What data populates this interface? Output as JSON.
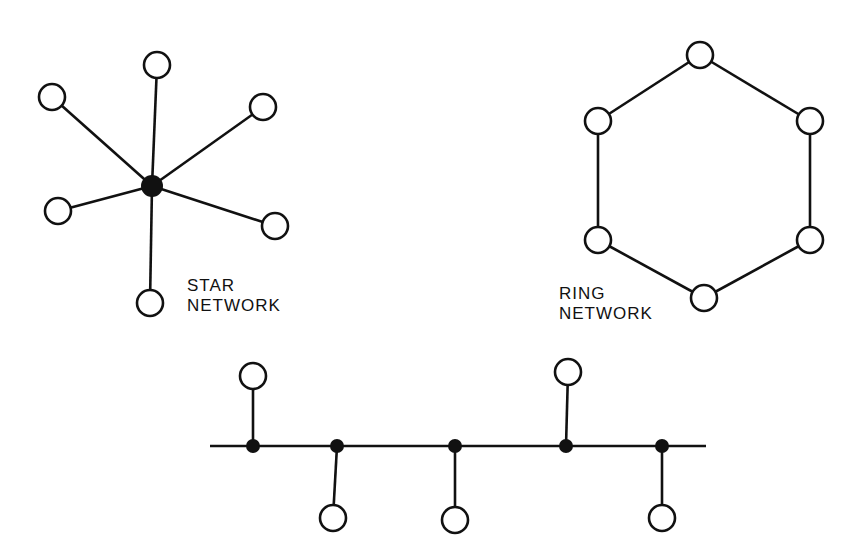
{
  "star": {
    "label_line1": "STAR",
    "label_line2": "NETWORK",
    "hub": [
      152,
      186
    ],
    "nodes": [
      [
        157,
        65
      ],
      [
        52,
        97
      ],
      [
        263,
        107
      ],
      [
        58,
        211
      ],
      [
        275,
        226
      ],
      [
        150,
        303
      ]
    ]
  },
  "ring": {
    "label_line1": "RING",
    "label_line2": "NETWORK",
    "nodes": [
      [
        700,
        55
      ],
      [
        810,
        121
      ],
      [
        810,
        240
      ],
      [
        704,
        298
      ],
      [
        598,
        240
      ],
      [
        598,
        121
      ]
    ]
  },
  "bus": {
    "line": {
      "y": 446,
      "x1": 210,
      "x2": 706
    },
    "junctions": [
      {
        "x": 253,
        "node": [
          253,
          376
        ]
      },
      {
        "x": 337,
        "node": [
          333,
          518
        ]
      },
      {
        "x": 455,
        "node": [
          455,
          520
        ]
      },
      {
        "x": 566,
        "node": [
          568,
          372
        ]
      },
      {
        "x": 662,
        "node": [
          662,
          518
        ]
      }
    ]
  },
  "colors": {
    "stroke": "#111111",
    "background": "#ffffff"
  }
}
